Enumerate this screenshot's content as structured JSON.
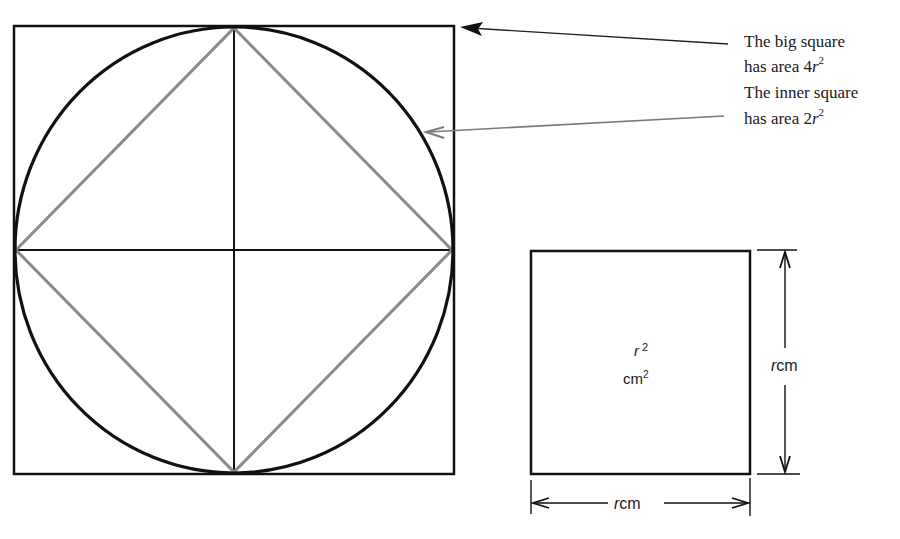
{
  "annotations": {
    "big_square_line1": "The big square",
    "big_square_line2_prefix": "has area 4",
    "big_square_var": "r",
    "big_square_exp": "2",
    "inner_square_line1": "The inner square",
    "inner_square_line2_prefix": "has area 2",
    "inner_square_var": "r",
    "inner_square_exp": "2"
  },
  "small_square": {
    "area_var": "r",
    "area_exp": "2",
    "area_unit": "cm",
    "area_unit_exp": "2",
    "height_var": "r",
    "height_unit": "cm",
    "width_var": "r",
    "width_unit": "cm"
  },
  "colors": {
    "ink": "#111111",
    "inner_square": "#8a8a8a",
    "arrow_gray": "#7a7a7a"
  }
}
